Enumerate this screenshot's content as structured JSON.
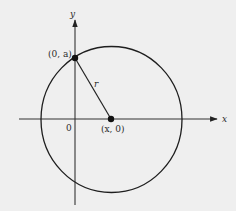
{
  "figure": {
    "type": "geometry-diagram",
    "background": "#efefef",
    "stroke_color": "#222222"
  },
  "axes": {
    "x_label": "x",
    "y_label": "y",
    "origin_label": "0"
  },
  "circle": {
    "center_label": "(x, 0)",
    "radius_label": "r"
  },
  "points": [
    {
      "name": "y-intercept",
      "label": "(0, a)"
    },
    {
      "name": "center",
      "label": "(x, 0)"
    }
  ]
}
